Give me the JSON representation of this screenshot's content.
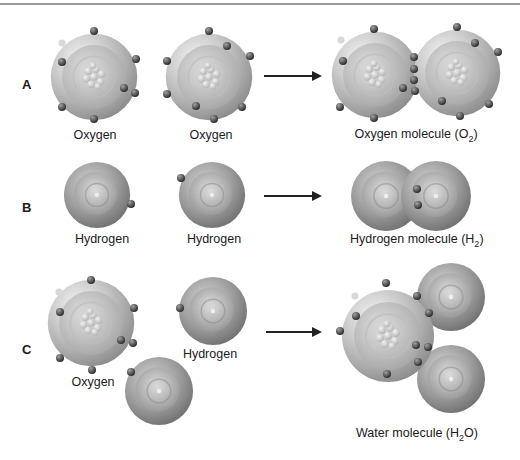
{
  "figure": {
    "rows": [
      {
        "label": "A",
        "reactants": [
          {
            "caption": "Oxygen"
          },
          {
            "caption": "Oxygen"
          }
        ],
        "product": {
          "caption_prefix": "Oxygen molecule (O",
          "caption_sub": "2",
          "caption_suffix": ")"
        }
      },
      {
        "label": "B",
        "reactants": [
          {
            "caption": "Hydrogen"
          },
          {
            "caption": "Hydrogen"
          }
        ],
        "product": {
          "caption_prefix": "Hydrogen molecule (H",
          "caption_sub": "2",
          "caption_suffix": ")"
        }
      },
      {
        "label": "C",
        "reactants": [
          {
            "caption": "Oxygen"
          },
          {
            "caption": "Hydrogen"
          }
        ],
        "product": {
          "caption_prefix": "Water molecule (H",
          "caption_sub": "2",
          "caption_suffix": "O)"
        }
      }
    ]
  }
}
